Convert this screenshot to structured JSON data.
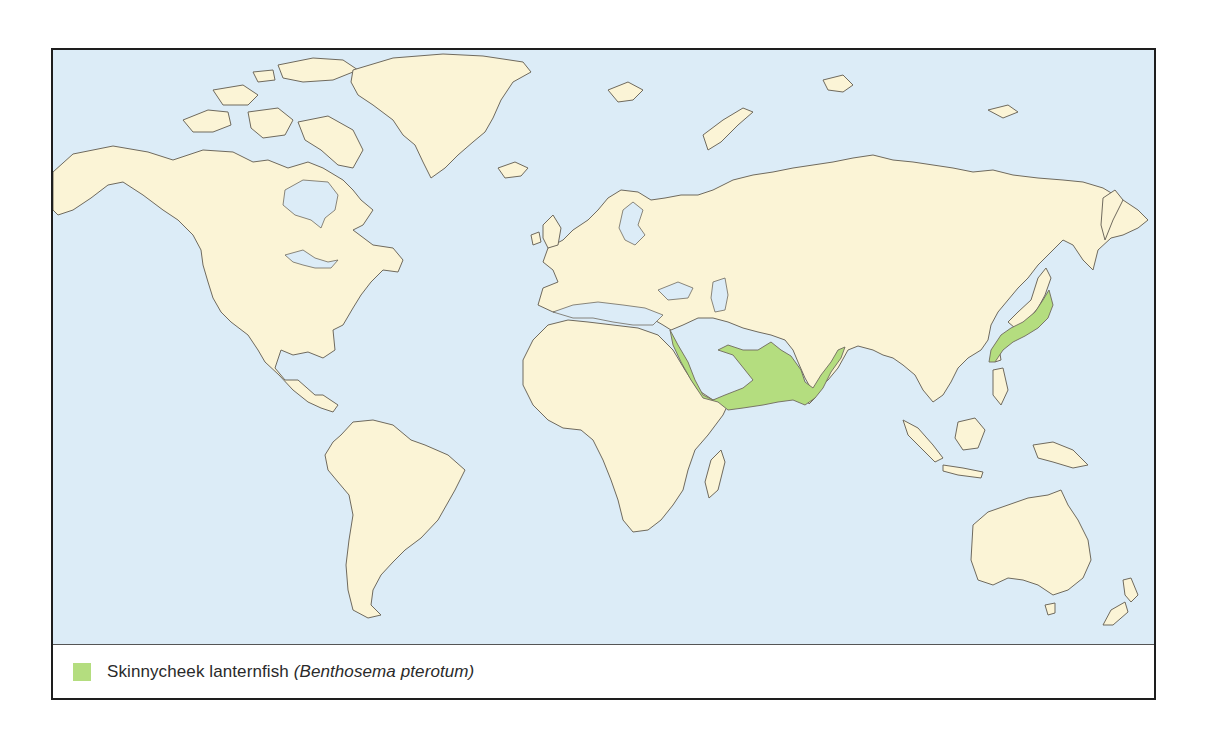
{
  "map": {
    "title": "Distribution map",
    "colors": {
      "ocean": "#dcecf7",
      "land": "#fbf4d6",
      "coastline": "#6f6a5e",
      "range": "#b4dd7f",
      "frame": "#1e1e1e"
    },
    "projection": "world (Miller-style), Pacific split at frame edges",
    "highlighted_regions": [
      "Red Sea",
      "Gulf of Aden",
      "Arabian Sea",
      "Persian Gulf coast",
      "Bay of Bengal (west coast)",
      "East China Sea / southern Japan coast"
    ]
  },
  "legend": {
    "swatch_color": "#b4dd7f",
    "common_name": "Skinnycheek lanternfish",
    "scientific_name": "(Benthosema pterotum)"
  }
}
